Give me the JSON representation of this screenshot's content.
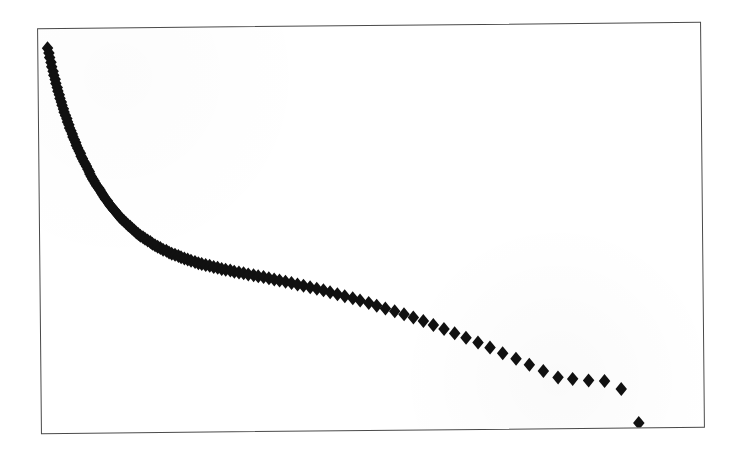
{
  "figure": {
    "kind": "scanned-scatter-plot",
    "background_color": "#ffffff",
    "frame_color": "#4a4a4a",
    "marker_color": "#111111",
    "marker_shape": "filled-diamond",
    "caption": ""
  },
  "chart_data": {
    "type": "scatter",
    "title": "",
    "subtitle": "",
    "xlabel": "",
    "ylabel": "",
    "xticks": [],
    "yticks": [],
    "xticklabels": [],
    "yticklabels": [],
    "xlim": [
      0,
      100
    ],
    "ylim": [
      0,
      100
    ],
    "grid": false,
    "legend": false,
    "legend_position": "none",
    "annotations": [],
    "series": [
      {
        "name": "",
        "marker": "diamond",
        "color": "#111111",
        "marker_size": 7,
        "note": "Monotonic decaying rank-ordered curve: dense overlapping markers form a near-solid band at the steep left limb, individual diamonds resolve toward the sparse right tail, ending with one low outlier.",
        "points": [
          [
            1.4,
            95.3
          ],
          [
            1.6,
            94.1
          ],
          [
            1.7,
            93.0
          ],
          [
            1.9,
            91.8
          ],
          [
            2.0,
            90.7
          ],
          [
            2.2,
            89.6
          ],
          [
            2.3,
            88.6
          ],
          [
            2.5,
            87.6
          ],
          [
            2.6,
            86.6
          ],
          [
            2.8,
            85.6
          ],
          [
            2.9,
            84.7
          ],
          [
            3.1,
            83.8
          ],
          [
            3.2,
            82.9
          ],
          [
            3.4,
            82.0
          ],
          [
            3.5,
            81.2
          ],
          [
            3.7,
            80.3
          ],
          [
            3.8,
            79.5
          ],
          [
            4.0,
            78.7
          ],
          [
            4.2,
            77.9
          ],
          [
            4.3,
            77.1
          ],
          [
            4.5,
            76.4
          ],
          [
            4.6,
            75.6
          ],
          [
            4.8,
            74.9
          ],
          [
            5.0,
            74.1
          ],
          [
            5.1,
            73.4
          ],
          [
            5.3,
            72.7
          ],
          [
            5.5,
            72.0
          ],
          [
            5.6,
            71.3
          ],
          [
            5.8,
            70.6
          ],
          [
            6.0,
            69.9
          ],
          [
            6.2,
            69.3
          ],
          [
            6.3,
            68.6
          ],
          [
            6.5,
            68.0
          ],
          [
            6.7,
            67.3
          ],
          [
            6.9,
            66.7
          ],
          [
            7.1,
            66.1
          ],
          [
            7.3,
            65.4
          ],
          [
            7.5,
            64.8
          ],
          [
            7.6,
            64.2
          ],
          [
            7.8,
            63.6
          ],
          [
            8.0,
            63.0
          ],
          [
            8.2,
            62.5
          ],
          [
            8.4,
            61.9
          ],
          [
            8.6,
            61.3
          ],
          [
            8.9,
            60.7
          ],
          [
            9.1,
            60.2
          ],
          [
            9.3,
            59.6
          ],
          [
            9.5,
            59.1
          ],
          [
            9.7,
            58.5
          ],
          [
            9.9,
            58.0
          ],
          [
            10.2,
            57.5
          ],
          [
            10.4,
            56.9
          ],
          [
            10.6,
            56.4
          ],
          [
            10.9,
            55.9
          ],
          [
            11.1,
            55.4
          ],
          [
            11.4,
            54.9
          ],
          [
            11.6,
            54.4
          ],
          [
            11.9,
            53.9
          ],
          [
            12.1,
            53.4
          ],
          [
            12.4,
            52.9
          ],
          [
            12.7,
            52.5
          ],
          [
            13.0,
            52.0
          ],
          [
            13.3,
            51.5
          ],
          [
            13.6,
            51.1
          ],
          [
            13.9,
            50.6
          ],
          [
            14.2,
            50.2
          ],
          [
            14.5,
            49.7
          ],
          [
            14.8,
            49.3
          ],
          [
            15.1,
            48.9
          ],
          [
            15.5,
            48.5
          ],
          [
            15.8,
            48.1
          ],
          [
            16.2,
            47.7
          ],
          [
            16.6,
            47.3
          ],
          [
            16.9,
            46.9
          ],
          [
            17.3,
            46.5
          ],
          [
            17.7,
            46.1
          ],
          [
            18.1,
            45.8
          ],
          [
            18.5,
            45.4
          ],
          [
            19.0,
            45.1
          ],
          [
            19.4,
            44.7
          ],
          [
            19.8,
            44.4
          ],
          [
            20.3,
            44.1
          ],
          [
            20.8,
            43.8
          ],
          [
            21.2,
            43.5
          ],
          [
            21.7,
            43.2
          ],
          [
            22.2,
            42.9
          ],
          [
            22.7,
            42.6
          ],
          [
            23.3,
            42.3
          ],
          [
            23.8,
            42.0
          ],
          [
            24.3,
            41.8
          ],
          [
            24.9,
            41.5
          ],
          [
            25.5,
            41.3
          ],
          [
            26.1,
            41.0
          ],
          [
            26.7,
            40.8
          ],
          [
            27.3,
            40.5
          ],
          [
            27.9,
            40.3
          ],
          [
            28.6,
            40.1
          ],
          [
            29.2,
            39.8
          ],
          [
            29.9,
            39.6
          ],
          [
            30.6,
            39.4
          ],
          [
            31.3,
            39.1
          ],
          [
            32.1,
            38.9
          ],
          [
            32.8,
            38.6
          ],
          [
            33.6,
            38.4
          ],
          [
            34.4,
            38.1
          ],
          [
            35.2,
            37.8
          ],
          [
            36.0,
            37.5
          ],
          [
            36.9,
            37.2
          ],
          [
            37.8,
            36.9
          ],
          [
            38.7,
            36.5
          ],
          [
            39.6,
            36.2
          ],
          [
            40.6,
            35.8
          ],
          [
            41.6,
            35.4
          ],
          [
            42.6,
            35.0
          ],
          [
            43.6,
            34.5
          ],
          [
            44.7,
            34.0
          ],
          [
            45.8,
            33.5
          ],
          [
            47.0,
            33.0
          ],
          [
            48.1,
            32.4
          ],
          [
            49.4,
            31.8
          ],
          [
            50.6,
            31.1
          ],
          [
            51.9,
            30.4
          ],
          [
            53.3,
            29.7
          ],
          [
            54.7,
            28.9
          ],
          [
            56.1,
            28.1
          ],
          [
            57.6,
            27.2
          ],
          [
            59.1,
            26.2
          ],
          [
            60.7,
            25.2
          ],
          [
            62.3,
            24.1
          ],
          [
            64.0,
            23.0
          ],
          [
            65.8,
            21.8
          ],
          [
            67.6,
            20.5
          ],
          [
            69.5,
            19.1
          ],
          [
            71.5,
            17.7
          ],
          [
            73.5,
            16.2
          ],
          [
            75.6,
            14.6
          ],
          [
            77.8,
            13.0
          ],
          [
            80.0,
            12.6
          ],
          [
            82.4,
            12.2
          ],
          [
            84.8,
            12.0
          ],
          [
            87.3,
            10.0
          ],
          [
            89.9,
            1.6
          ]
        ]
      }
    ]
  }
}
